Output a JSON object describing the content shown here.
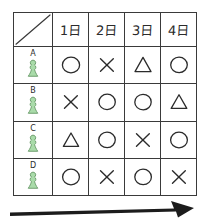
{
  "table": {
    "corner": {
      "icon": "diagonal-slash"
    },
    "columns": [
      {
        "label": "1日"
      },
      {
        "label": "2日"
      },
      {
        "label": "3日"
      },
      {
        "label": "4日"
      }
    ],
    "rows": [
      {
        "letter": "A",
        "icon": "pawn-icon",
        "marks": [
          {
            "symbol": "○",
            "name": "circle"
          },
          {
            "symbol": "×",
            "name": "cross"
          },
          {
            "symbol": "△",
            "name": "triangle"
          },
          {
            "symbol": "○",
            "name": "circle"
          }
        ]
      },
      {
        "letter": "B",
        "icon": "pawn-icon",
        "marks": [
          {
            "symbol": "×",
            "name": "cross"
          },
          {
            "symbol": "○",
            "name": "circle"
          },
          {
            "symbol": "○",
            "name": "circle"
          },
          {
            "symbol": "△",
            "name": "triangle"
          }
        ]
      },
      {
        "letter": "C",
        "icon": "pawn-icon",
        "marks": [
          {
            "symbol": "△",
            "name": "triangle"
          },
          {
            "symbol": "○",
            "name": "circle"
          },
          {
            "symbol": "×",
            "name": "cross"
          },
          {
            "symbol": "○",
            "name": "circle"
          }
        ]
      },
      {
        "letter": "D",
        "icon": "pawn-icon",
        "marks": [
          {
            "symbol": "○",
            "name": "circle"
          },
          {
            "symbol": "×",
            "name": "cross"
          },
          {
            "symbol": "○",
            "name": "circle"
          },
          {
            "symbol": "×",
            "name": "cross"
          }
        ]
      }
    ]
  },
  "timeline_arrow": {
    "icon": "right-arrow-icon",
    "direction": "right"
  },
  "colors": {
    "ink": "#2b2b2b",
    "grid": "#3a3a3a",
    "pawn_fill": "#a9dba9",
    "pawn_stroke": "#6f9f6f",
    "arrow": "#1c1c1c",
    "background": "#ffffff"
  }
}
